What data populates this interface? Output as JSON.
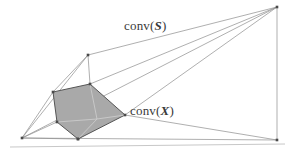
{
  "figure": {
    "background_color": "#ffffff",
    "width": 292,
    "height": 149
  },
  "labels": {
    "conv_s": {
      "prefix": "conv(",
      "variable": "S",
      "suffix": ")",
      "x": 124,
      "y": 18,
      "color": "#3a3a3a"
    },
    "conv_x": {
      "prefix": "conv(",
      "variable": "X",
      "suffix": ")",
      "x": 130,
      "y": 103,
      "color": "#3a3a3a"
    }
  },
  "chart_data": {
    "type": "diagram",
    "colors": {
      "line": "#8c8c8c",
      "inner_line": "#555555",
      "inner_fill": "#a9a9a9",
      "vertex": "#4a4a4a",
      "baseline": "#c8c8c8"
    },
    "outer_hull_label": "conv(S)",
    "inner_hull_label": "conv(X)",
    "outer_hull_vertices": [
      [
        22,
        138
      ],
      [
        88,
        55
      ],
      [
        277,
        7
      ],
      [
        277,
        140
      ],
      [
        78,
        139
      ]
    ],
    "inner_hull_vertices": [
      [
        53,
        92
      ],
      [
        90,
        84
      ],
      [
        125,
        115
      ],
      [
        78,
        139
      ],
      [
        57,
        122
      ]
    ],
    "inner_interior_point": [
      97,
      119
    ],
    "edges": [
      [
        [
          22,
          138
        ],
        [
          88,
          55
        ]
      ],
      [
        [
          88,
          55
        ],
        [
          277,
          7
        ]
      ],
      [
        [
          277,
          7
        ],
        [
          277,
          140
        ]
      ],
      [
        [
          277,
          140
        ],
        [
          22,
          138
        ]
      ],
      [
        [
          22,
          138
        ],
        [
          277,
          7
        ]
      ],
      [
        [
          88,
          55
        ],
        [
          90,
          84
        ]
      ],
      [
        [
          88,
          55
        ],
        [
          53,
          92
        ]
      ],
      [
        [
          90,
          84
        ],
        [
          277,
          7
        ]
      ],
      [
        [
          125,
          115
        ],
        [
          277,
          7
        ]
      ],
      [
        [
          125,
          115
        ],
        [
          277,
          140
        ]
      ],
      [
        [
          53,
          92
        ],
        [
          22,
          138
        ]
      ],
      [
        [
          57,
          122
        ],
        [
          22,
          138
        ]
      ],
      [
        [
          78,
          139
        ],
        [
          22,
          138
        ]
      ],
      [
        [
          125,
          115
        ],
        [
          97,
          119
        ]
      ],
      [
        [
          90,
          84
        ],
        [
          97,
          119
        ]
      ],
      [
        [
          97,
          119
        ],
        [
          57,
          122
        ]
      ],
      [
        [
          97,
          119
        ],
        [
          78,
          139
        ]
      ]
    ],
    "baseline": [
      [
        10,
        147
      ],
      [
        285,
        144
      ]
    ]
  }
}
